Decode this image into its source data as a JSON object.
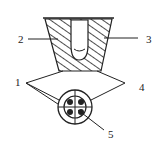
{
  "diagram": {
    "labels": [
      {
        "id": "1",
        "text": "1"
      },
      {
        "id": "2",
        "text": "2"
      },
      {
        "id": "3",
        "text": "3"
      },
      {
        "id": "4",
        "text": "4"
      },
      {
        "id": "5",
        "text": "5"
      }
    ],
    "colors": {
      "stroke": "#222222",
      "background": "#ffffff"
    }
  }
}
